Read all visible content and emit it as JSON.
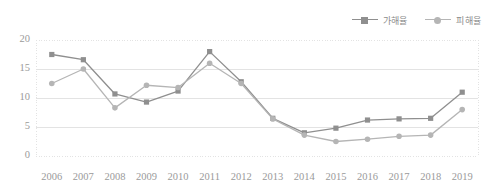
{
  "chart_data": {
    "type": "line",
    "title": "",
    "xlabel": "",
    "ylabel": "",
    "categories": [
      "2006",
      "2007",
      "2008",
      "2009",
      "2010",
      "2011",
      "2012",
      "2013",
      "2014",
      "2015",
      "2016",
      "2017",
      "2018",
      "2019"
    ],
    "series": [
      {
        "name": "가해율",
        "marker": "square",
        "color": "#8f8f8f",
        "values": [
          17.5,
          16.6,
          10.7,
          9.3,
          11.2,
          18.0,
          12.8,
          6.5,
          4.0,
          4.8,
          6.2,
          6.4,
          6.5,
          11.0
        ]
      },
      {
        "name": "피해율",
        "marker": "circle",
        "color": "#b5b5b5",
        "values": [
          12.5,
          15.0,
          8.3,
          12.2,
          11.8,
          16.0,
          12.5,
          6.4,
          3.6,
          2.5,
          2.9,
          3.4,
          3.6,
          8.0
        ]
      }
    ],
    "ylim": [
      0,
      20
    ],
    "yticks": [
      0,
      5,
      10,
      15,
      20
    ],
    "ytick_labels": [
      "0",
      "5",
      "10",
      "15",
      "20"
    ],
    "grid": true,
    "legend_position": "top-right"
  },
  "colors": {
    "series1": "#8f8f8f",
    "series2": "#b5b5b5",
    "grid": "#e3e3e3",
    "axis_text": "#9a9a9a",
    "legend_text": "#8c8c8c",
    "background": "#ffffff"
  }
}
